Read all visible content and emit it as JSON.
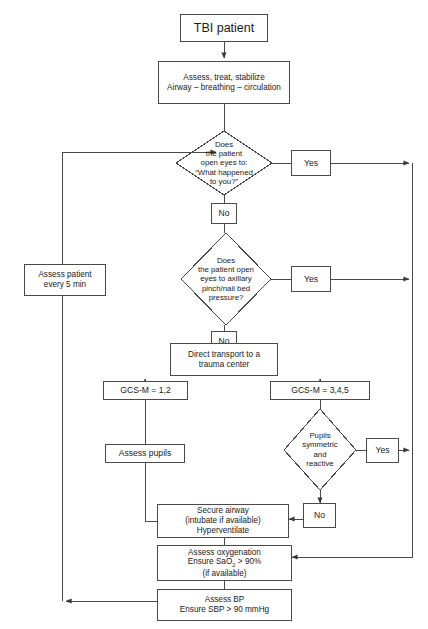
{
  "figure": {
    "kind": "clinical-decision-flowchart",
    "canvas": {
      "width": 428,
      "height": 629
    },
    "stroke_color": "#4a4a4a",
    "background_color": "#ffffff",
    "text_color": "#1a1a1a"
  },
  "nodes": {
    "tbi_patient": {
      "label": "TBI patient",
      "shape": "box"
    },
    "assess_stabilize": {
      "line1": "Assess, treat, stabilize",
      "line2": "Airway – breathing – circulation",
      "shape": "box"
    },
    "decision_eyes_voice": {
      "line1": "Does",
      "line2": "the patient",
      "line3": "open eyes to:",
      "line4": "“What happened",
      "line5": "to you?”",
      "shape": "diamond"
    },
    "yes_1": {
      "label": "Yes",
      "shape": "box"
    },
    "no_1": {
      "label": "No",
      "shape": "box"
    },
    "decision_eyes_pain": {
      "line1": "Does",
      "line2": "the patient open",
      "line3": "eyes to axillary",
      "line4": "pinch/nail bed",
      "line5": "pressure?",
      "shape": "diamond"
    },
    "yes_2": {
      "label": "Yes",
      "shape": "box"
    },
    "no_2": {
      "label": "No",
      "shape": "box"
    },
    "assess_every_5min": {
      "line1": "Assess patient",
      "line2": "every 5 min",
      "shape": "box"
    },
    "direct_transport": {
      "line1": "Direct transport to a",
      "line2": "trauma center",
      "shape": "box"
    },
    "gcs_m_12": {
      "label": "GCS-M = 1,2",
      "shape": "box"
    },
    "gcs_m_345": {
      "label": "GCS-M = 3,4,5",
      "shape": "box"
    },
    "assess_pupils": {
      "label": "Assess pupils",
      "shape": "box"
    },
    "decision_pupils": {
      "line1": "Pupils",
      "line2": "symmetric",
      "line3": "and",
      "line4": "reactive",
      "shape": "diamond"
    },
    "yes_3": {
      "label": "Yes",
      "shape": "box"
    },
    "no_3": {
      "label": "No",
      "shape": "box"
    },
    "secure_airway": {
      "line1": "Secure airway",
      "line2": "(intubate if available)",
      "line3": "Hyperventilate",
      "shape": "box"
    },
    "assess_oxygenation": {
      "line1": "Assess oxygenation",
      "line2_prefix": "Ensure SaO",
      "line2_sub": "2",
      "line2_suffix": " > 90%",
      "line3": "(if available)",
      "shape": "box"
    },
    "assess_bp": {
      "line1": "Assess BP",
      "line2": "Ensure SBP > 90 mmHg",
      "shape": "box"
    }
  },
  "edges": [
    {
      "from": "tbi_patient",
      "to": "assess_stabilize",
      "label": ""
    },
    {
      "from": "assess_stabilize",
      "to": "decision_eyes_voice",
      "label": ""
    },
    {
      "from": "decision_eyes_voice",
      "to": "yes_1",
      "label": "Yes"
    },
    {
      "from": "decision_eyes_voice",
      "to": "no_1",
      "label": "No"
    },
    {
      "from": "yes_1",
      "to": "assess_oxygenation",
      "label": ""
    },
    {
      "from": "no_1",
      "to": "decision_eyes_pain",
      "label": ""
    },
    {
      "from": "decision_eyes_pain",
      "to": "yes_2",
      "label": "Yes"
    },
    {
      "from": "decision_eyes_pain",
      "to": "no_2",
      "label": "No"
    },
    {
      "from": "yes_2",
      "to": "assess_oxygenation",
      "label": ""
    },
    {
      "from": "no_2",
      "to": "direct_transport",
      "label": ""
    },
    {
      "from": "direct_transport",
      "to": "gcs_m_12",
      "label": ""
    },
    {
      "from": "direct_transport",
      "to": "gcs_m_345",
      "label": ""
    },
    {
      "from": "gcs_m_12",
      "to": "assess_pupils",
      "label": ""
    },
    {
      "from": "assess_pupils",
      "to": "secure_airway",
      "label": ""
    },
    {
      "from": "gcs_m_345",
      "to": "decision_pupils",
      "label": ""
    },
    {
      "from": "decision_pupils",
      "to": "yes_3",
      "label": "Yes"
    },
    {
      "from": "decision_pupils",
      "to": "no_3",
      "label": "No"
    },
    {
      "from": "yes_3",
      "to": "assess_oxygenation",
      "label": ""
    },
    {
      "from": "no_3",
      "to": "secure_airway",
      "label": ""
    },
    {
      "from": "secure_airway",
      "to": "assess_oxygenation",
      "label": ""
    },
    {
      "from": "assess_oxygenation",
      "to": "assess_bp",
      "label": ""
    },
    {
      "from": "assess_bp",
      "to": "assess_every_5min",
      "label": ""
    },
    {
      "from": "assess_every_5min",
      "to": "decision_eyes_voice",
      "label": ""
    }
  ]
}
